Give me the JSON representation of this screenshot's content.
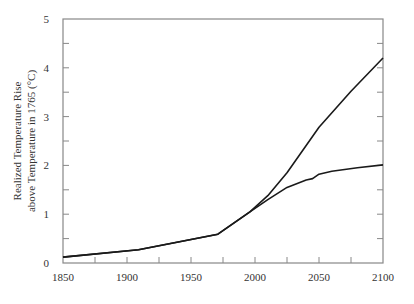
{
  "chart_data": {
    "type": "line",
    "title": "",
    "xlabel": "",
    "ylabel": [
      "Realized Temperature Rise",
      "above Temperature in 1765 (°C)"
    ],
    "xlim": [
      1850,
      2100
    ],
    "ylim": [
      0,
      5
    ],
    "grid": false,
    "legend": null,
    "x_ticks": [
      1850,
      1900,
      1950,
      2000,
      2050,
      2100
    ],
    "x_tick_labels": [
      "1850",
      "1900",
      "1950",
      "2000",
      "2050",
      "2100"
    ],
    "x_minor_ticks": [
      1875,
      1925,
      1975,
      2025,
      2075
    ],
    "y_ticks": [
      0,
      1,
      2,
      3,
      4,
      5
    ],
    "y_tick_labels": [
      "0",
      "1",
      "2",
      "3",
      "4",
      "5"
    ],
    "y_minor_ticks": [
      0.5,
      1.5,
      2.5,
      3.5,
      4.5
    ],
    "series": [
      {
        "name": "upper trajectory",
        "x": [
          1850,
          1909,
          1971,
          1996,
          2010,
          2025,
          2050,
          2075,
          2100
        ],
        "y": [
          0.12,
          0.27,
          0.59,
          1.05,
          1.38,
          1.85,
          2.78,
          3.52,
          4.2
        ]
      },
      {
        "name": "lower trajectory",
        "x": [
          1850,
          1909,
          1971,
          1996,
          2010,
          2025,
          2040,
          2045,
          2050,
          2060,
          2080,
          2100
        ],
        "y": [
          0.12,
          0.27,
          0.59,
          1.05,
          1.3,
          1.55,
          1.7,
          1.73,
          1.82,
          1.88,
          1.95,
          2.01
        ]
      }
    ],
    "colors": {
      "line": "#1a1a1a",
      "axis": "#888888",
      "text": "#333333"
    }
  }
}
